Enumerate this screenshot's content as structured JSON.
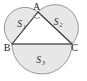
{
  "figure": {
    "background_color": "#ffffff",
    "fill_color": "#e7e7e7",
    "arc_stroke_color": "#8d8d8d",
    "triangle_stroke_color": "#3a3a3a",
    "label_color": "#1f1f1f"
  },
  "vertices": [
    {
      "name": "A",
      "label": "A",
      "x": 38,
      "y": 12,
      "label_x": 36.5,
      "label_y": 9.5
    },
    {
      "name": "B",
      "label": "B",
      "x": 12,
      "y": 44,
      "label_x": 7.0,
      "label_y": 50.5
    },
    {
      "name": "C",
      "label": "C",
      "x": 72,
      "y": 44,
      "label_x": 74.5,
      "label_y": 50.5
    }
  ],
  "regions": [
    {
      "name": "S1",
      "base": "S",
      "subscript": "1",
      "side": "AB",
      "label_x": 19.5,
      "label_y": 26.5,
      "description": "semicircle on side AB, bulging up-left"
    },
    {
      "name": "S2",
      "base": "S",
      "subscript": "2",
      "side": "AC",
      "label_x": 56.0,
      "label_y": 24.5,
      "description": "semicircle on side AC, bulging up-right"
    },
    {
      "name": "S3",
      "base": "S",
      "subscript": "3",
      "side": "BC",
      "label_x": 38.5,
      "label_y": 62.5,
      "description": "semicircle on side BC, bulging downward"
    }
  ],
  "angle_marks": [
    {
      "name": "right-angle-at-A",
      "vertex": "A",
      "path": "M 33.6 16.2 A 5.2 5.2 0 0 0 40.3 17.6",
      "description": "small arc marking the angle at vertex A"
    }
  ],
  "geometry_paths": {
    "semicircle_AB": "M 38 12 A 16.64 16.64 0 0 0 12 44 L 38 12 Z",
    "semicircle_AC": "M 38 12 A 17.6 17.6 0 0 1 72 44 L 38 12 Z",
    "semicircle_BC": "M 12 44 A 30 30 0 0 0 72 44 Z",
    "triangle_AB": "M 38 12 L 12 44",
    "triangle_AC": "M 38 12 L 72 44",
    "triangle_BC": "M 12 44 L 72 44"
  }
}
